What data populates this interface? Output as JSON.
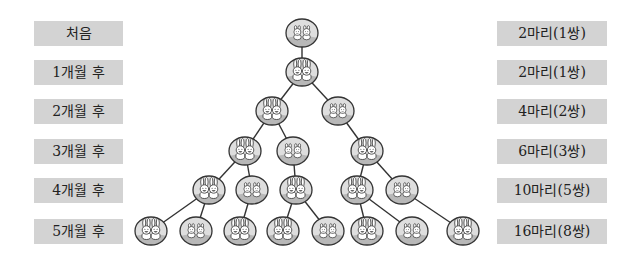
{
  "diagram": {
    "type": "rabbit-population-tree",
    "rows": [
      {
        "label": "처음",
        "count": "2마리(1쌍)",
        "y": 33
      },
      {
        "label": "1개월 후",
        "count": "2마리(1쌍)",
        "y": 72
      },
      {
        "label": "2개월 후",
        "count": "4마리(2쌍)",
        "y": 111
      },
      {
        "label": "3개월 후",
        "count": "6마리(3쌍)",
        "y": 151
      },
      {
        "label": "4개월 후",
        "count": "10마리(5쌍)",
        "y": 190
      },
      {
        "label": "5개월 후",
        "count": "16마리(8쌍)",
        "y": 231
      }
    ],
    "nodes": [
      {
        "id": "n0",
        "row": 0,
        "x": 302,
        "kind": "baby"
      },
      {
        "id": "n1",
        "row": 1,
        "x": 302,
        "kind": "adult"
      },
      {
        "id": "n2a",
        "row": 2,
        "x": 272,
        "kind": "adult"
      },
      {
        "id": "n2b",
        "row": 2,
        "x": 338,
        "kind": "baby"
      },
      {
        "id": "n3a",
        "row": 3,
        "x": 245,
        "kind": "adult"
      },
      {
        "id": "n3b",
        "row": 3,
        "x": 293,
        "kind": "baby"
      },
      {
        "id": "n3c",
        "row": 3,
        "x": 367,
        "kind": "adult"
      },
      {
        "id": "n4a",
        "row": 4,
        "x": 209,
        "kind": "adult"
      },
      {
        "id": "n4b",
        "row": 4,
        "x": 252,
        "kind": "baby"
      },
      {
        "id": "n4c",
        "row": 4,
        "x": 296,
        "kind": "adult"
      },
      {
        "id": "n4d",
        "row": 4,
        "x": 357,
        "kind": "adult"
      },
      {
        "id": "n4e",
        "row": 4,
        "x": 402,
        "kind": "baby"
      },
      {
        "id": "n5a",
        "row": 5,
        "x": 151,
        "kind": "adult"
      },
      {
        "id": "n5b",
        "row": 5,
        "x": 196,
        "kind": "baby"
      },
      {
        "id": "n5c",
        "row": 5,
        "x": 240,
        "kind": "adult"
      },
      {
        "id": "n5d",
        "row": 5,
        "x": 283,
        "kind": "adult"
      },
      {
        "id": "n5e",
        "row": 5,
        "x": 328,
        "kind": "baby"
      },
      {
        "id": "n5f",
        "row": 5,
        "x": 367,
        "kind": "adult"
      },
      {
        "id": "n5g",
        "row": 5,
        "x": 412,
        "kind": "baby"
      },
      {
        "id": "n5h",
        "row": 5,
        "x": 463,
        "kind": "adult"
      }
    ],
    "edges": [
      [
        "n0",
        "n1"
      ],
      [
        "n1",
        "n2a"
      ],
      [
        "n1",
        "n2b"
      ],
      [
        "n2a",
        "n3a"
      ],
      [
        "n2a",
        "n3b"
      ],
      [
        "n2b",
        "n3c"
      ],
      [
        "n3a",
        "n4a"
      ],
      [
        "n3a",
        "n4b"
      ],
      [
        "n3b",
        "n4c"
      ],
      [
        "n3c",
        "n4d"
      ],
      [
        "n3c",
        "n4e"
      ],
      [
        "n4a",
        "n5a"
      ],
      [
        "n4a",
        "n5b"
      ],
      [
        "n4b",
        "n5c"
      ],
      [
        "n4c",
        "n5d"
      ],
      [
        "n4c",
        "n5e"
      ],
      [
        "n4d",
        "n5f"
      ],
      [
        "n4d",
        "n5g"
      ],
      [
        "n4e",
        "n5h"
      ]
    ],
    "colors": {
      "label_box": "#d3d3d3",
      "node_fill": "#dedede",
      "node_ground": "#b8b8b8",
      "stroke": "#333333"
    }
  }
}
